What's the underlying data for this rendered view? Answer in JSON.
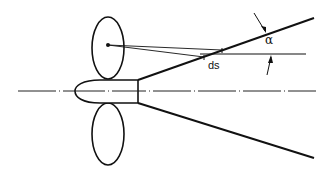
{
  "diagram": {
    "type": "technical-line-drawing",
    "labels": {
      "angle": "α",
      "element": "ds"
    },
    "elements": [
      {
        "name": "centerline",
        "style": "dash-dot"
      },
      {
        "name": "hub",
        "shape": "bullet"
      },
      {
        "name": "upper-blade",
        "shape": "ellipse"
      },
      {
        "name": "lower-blade",
        "shape": "ellipse"
      },
      {
        "name": "upper-cone-line"
      },
      {
        "name": "lower-cone-line"
      },
      {
        "name": "horizontal-reference-line"
      },
      {
        "name": "point-on-blade"
      },
      {
        "name": "angle-arrows",
        "label": "α"
      },
      {
        "name": "ds-element",
        "label": "ds"
      }
    ],
    "colors": {
      "stroke": "#111111",
      "background": "#ffffff"
    }
  }
}
